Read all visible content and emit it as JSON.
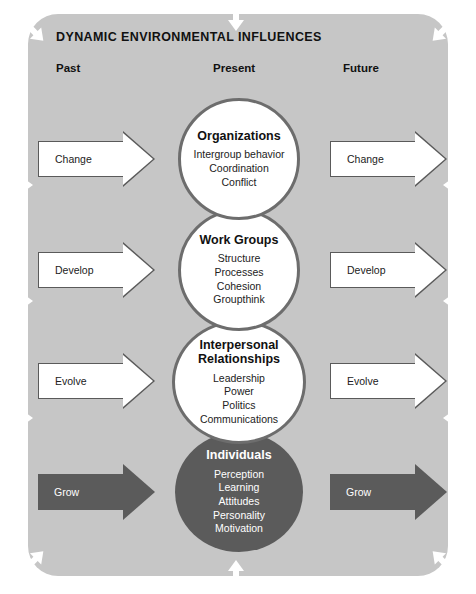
{
  "diagram": {
    "title": "DYNAMIC ENVIRONMENTAL INFLUENCES",
    "columns": {
      "past": "Past",
      "present": "Present",
      "future": "Future"
    },
    "colors": {
      "panel_background": "#c6c6c6",
      "circle_light_fill": "#ffffff",
      "circle_outline": "#6d6d6d",
      "circle_dark_fill": "#5b5b5b",
      "arrow_light_fill": "#ffffff",
      "arrow_dark_fill": "#5b5b5b",
      "env_arrow_fill": "#ffffff",
      "text_dark": "#111111",
      "text_light": "#ffffff"
    },
    "levels": [
      {
        "title": "Organizations",
        "items": [
          "Intergroup behavior",
          "Coordination",
          "Conflict"
        ],
        "style": "light",
        "past_arrow": "Change",
        "future_arrow": "Change",
        "arrow_style": "light"
      },
      {
        "title": "Work Groups",
        "items": [
          "Structure",
          "Processes",
          "Cohesion",
          "Groupthink"
        ],
        "style": "light",
        "past_arrow": "Develop",
        "future_arrow": "Develop",
        "arrow_style": "light"
      },
      {
        "title": "Interpersonal\nRelationships",
        "title_line1": "Interpersonal",
        "title_line2": "Relationships",
        "items": [
          "Leadership",
          "Power",
          "Politics",
          "Communications"
        ],
        "style": "light",
        "past_arrow": "Evolve",
        "future_arrow": "Evolve",
        "arrow_style": "light"
      },
      {
        "title": "Individuals",
        "items": [
          "Perception",
          "Learning",
          "Attitudes",
          "Personality",
          "Motivation"
        ],
        "style": "dark",
        "past_arrow": "Grow",
        "future_arrow": "Grow",
        "arrow_style": "dark"
      }
    ],
    "environment_arrows": {
      "description": "white arrows pointing inward around the panel border",
      "count": 12,
      "positions": [
        "top-left-diagonal",
        "top-center-down",
        "top-right-diagonal",
        "left-upper",
        "left-middle",
        "left-lower",
        "right-upper",
        "right-middle",
        "right-lower",
        "bottom-left-diagonal",
        "bottom-center-up",
        "bottom-right-diagonal"
      ]
    }
  }
}
